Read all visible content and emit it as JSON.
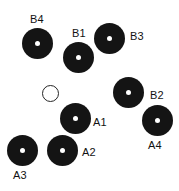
{
  "diagram": {
    "width": 179,
    "height": 191,
    "background_color": "#ffffff",
    "marker_fill_color": "#141414",
    "marker_hole_color": "#ffffff",
    "marker_outline_color": "#262626",
    "label_color": "#121212",
    "markers": [
      {
        "id": "B4",
        "label": "B4",
        "style": "filled",
        "cx": 37,
        "cy": 43,
        "diameter": 31,
        "label_x": 30,
        "label_y": 13
      },
      {
        "id": "B1",
        "label": "B1",
        "style": "filled",
        "cx": 78,
        "cy": 57,
        "diameter": 31,
        "label_x": 72,
        "label_y": 27
      },
      {
        "id": "B3",
        "label": "B3",
        "style": "filled",
        "cx": 109,
        "cy": 38,
        "diameter": 31,
        "label_x": 130,
        "label_y": 30
      },
      {
        "id": "B2",
        "label": "B2",
        "style": "filled",
        "cx": 128,
        "cy": 92,
        "diameter": 31,
        "label_x": 150,
        "label_y": 89
      },
      {
        "id": "A1",
        "label": "A1",
        "style": "filled",
        "cx": 75,
        "cy": 118,
        "diameter": 31,
        "label_x": 93,
        "label_y": 116
      },
      {
        "id": "A4",
        "label": "A4",
        "style": "filled",
        "cx": 157,
        "cy": 120,
        "diameter": 31,
        "label_x": 148,
        "label_y": 139
      },
      {
        "id": "A2",
        "label": "A2",
        "style": "filled",
        "cx": 62,
        "cy": 150,
        "diameter": 31,
        "label_x": 82,
        "label_y": 146
      },
      {
        "id": "A3",
        "label": "A3",
        "style": "filled",
        "cx": 22,
        "cy": 150,
        "diameter": 31,
        "label_x": 13,
        "label_y": 169
      },
      {
        "id": "open-marker",
        "label": "",
        "style": "open",
        "cx": 50,
        "cy": 93,
        "diameter": 17,
        "label_x": 0,
        "label_y": 0
      }
    ]
  }
}
